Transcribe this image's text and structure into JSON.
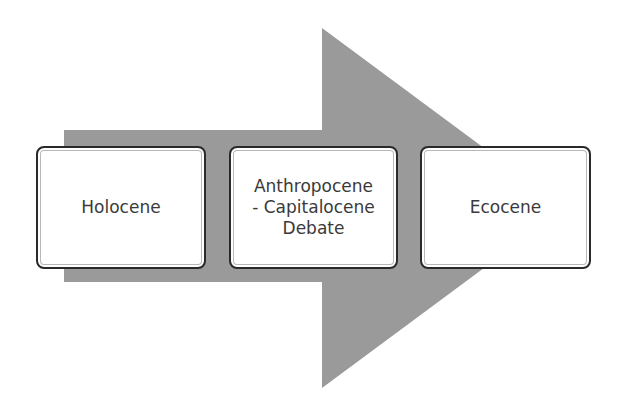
{
  "diagram": {
    "type": "process-arrow",
    "arrow_color": "#9a9a9a",
    "box_border_color": "#2a2a2a",
    "steps": [
      {
        "label": "Holocene"
      },
      {
        "label": "Anthropocene\n- Capitalocene\nDebate"
      },
      {
        "label": "Ecocene"
      }
    ]
  }
}
